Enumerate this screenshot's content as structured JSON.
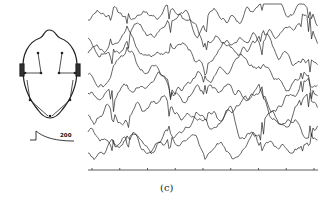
{
  "figure": {
    "caption": "(c)",
    "calibration": {
      "label": "200"
    },
    "head_diagram": {
      "channels": [
        "1",
        "2",
        "3",
        "4",
        "5",
        "6",
        "7",
        "8"
      ]
    },
    "colors": {
      "trace": "#222222",
      "background": "#ffffff",
      "axis": "#333333"
    }
  },
  "chart_data": {
    "type": "line",
    "title": "",
    "caption": "(c)",
    "xlabel": "",
    "ylabel": "",
    "series_count": 8,
    "calibration_label": "200",
    "x_ticks": 9,
    "series": [
      {
        "name": "ch1",
        "offset": 20
      },
      {
        "name": "ch2",
        "offset": 38
      },
      {
        "name": "ch3",
        "offset": 56
      },
      {
        "name": "ch4",
        "offset": 74
      },
      {
        "name": "ch5",
        "offset": 92
      },
      {
        "name": "ch6",
        "offset": 112
      },
      {
        "name": "ch7",
        "offset": 132
      },
      {
        "name": "ch8",
        "offset": 150
      }
    ],
    "grid": false,
    "legend": "none"
  }
}
